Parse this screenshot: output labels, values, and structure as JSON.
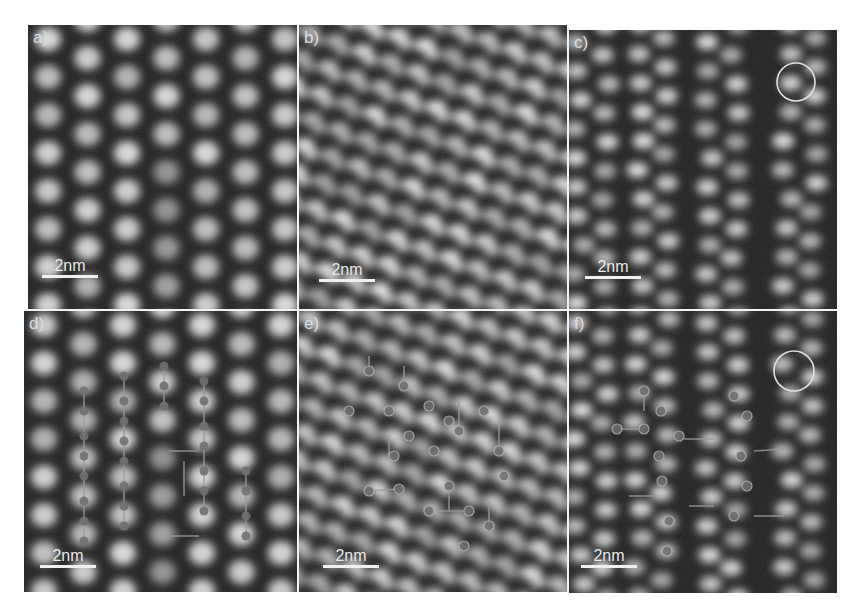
{
  "figure": {
    "panels": [
      {
        "id": "a",
        "label": "a)",
        "scale_bar": "2nm",
        "lattice": "columns",
        "overlay": "none"
      },
      {
        "id": "b",
        "label": "b)",
        "scale_bar": "2nm",
        "lattice": "hexagonal",
        "overlay": "none"
      },
      {
        "id": "c",
        "label": "c)",
        "scale_bar": "2nm",
        "lattice": "paired-columns",
        "overlay": "circle"
      },
      {
        "id": "d",
        "label": "d)",
        "scale_bar": "2nm",
        "lattice": "columns",
        "overlay": "atom-model"
      },
      {
        "id": "e",
        "label": "e)",
        "scale_bar": "2nm",
        "lattice": "hexagonal",
        "overlay": "atom-model"
      },
      {
        "id": "f",
        "label": "f)",
        "scale_bar": "2nm",
        "lattice": "paired-columns",
        "overlay": "atom-model-and-circle"
      }
    ],
    "caption_partial": "Fi..."
  },
  "colors": {
    "background": "#1e1e1e",
    "atom": "#d8d8d8",
    "overlay_marker": "#7a7a7a",
    "divider": "#f2f2f2"
  }
}
